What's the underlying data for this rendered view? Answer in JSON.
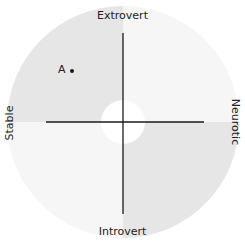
{
  "diagram": {
    "type": "personality-quadrant",
    "axes": {
      "top": "Extrovert",
      "bottom": "Introvert",
      "left": "Stable",
      "right": "Neurotic"
    },
    "points": [
      {
        "label": "A",
        "x": 72,
        "y": 70
      }
    ],
    "colors": {
      "quadrant_dark": "#e6e6e6",
      "quadrant_light": "#f6f6f6",
      "center": "#ffffff",
      "axis": "#1a1a1a",
      "point": "#1a1a1a"
    }
  }
}
